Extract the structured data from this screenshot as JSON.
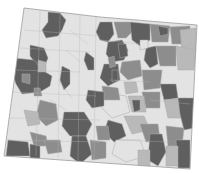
{
  "map": {
    "title": "",
    "subject": "Colorado choropleth (census-tract style)",
    "outline": [
      [
        24,
        8
      ],
      [
        100,
        17
      ],
      [
        197,
        25
      ],
      [
        190,
        169
      ],
      [
        4,
        156
      ]
    ],
    "palette": {
      "class1": "#e3e3e3",
      "class2": "#b9b9b9",
      "class3": "#8d8d8d",
      "class4": "#5f5f5f",
      "boundary": "#a8a8a8",
      "background": "#ffffff"
    },
    "regions": [
      {
        "cls": "class4",
        "points": "48,12 60,13 66,20 62,30 58,36 46,38 42,30 48,22"
      },
      {
        "cls": "class4",
        "points": "30,45 44,48 48,58 44,68 36,64 30,56"
      },
      {
        "cls": "class4",
        "points": "14,58 34,60 42,70 52,76 50,86 40,92 22,94 16,84 12,72"
      },
      {
        "cls": "class2",
        "points": "38,60 46,62 46,72 38,72"
      },
      {
        "cls": "class3",
        "points": "22,74 30,74 30,84 22,82"
      },
      {
        "cls": "class3",
        "points": "34,88 40,88 42,96 34,96"
      },
      {
        "cls": "class4",
        "points": "62,66 70,70 70,84 64,90 60,80"
      },
      {
        "cls": "class4",
        "points": "86,52 94,58 94,70 88,70 84,60"
      },
      {
        "cls": "class4",
        "points": "100,22 112,22 114,34 108,42 100,40 96,32"
      },
      {
        "cls": "class4",
        "points": "108,42 122,40 128,50 124,60 112,62 106,54"
      },
      {
        "cls": "class3",
        "points": "114,22 130,22 134,30 126,38 118,38"
      },
      {
        "cls": "class4",
        "points": "130,22 150,24 150,40 140,46 132,40"
      },
      {
        "cls": "class3",
        "points": "150,24 170,26 168,42 152,42"
      },
      {
        "cls": "class4",
        "points": "158,26 168,28 168,34 160,36"
      },
      {
        "cls": "class3",
        "points": "170,27 190,26 190,44 172,44"
      },
      {
        "cls": "class2",
        "points": "180,30 196,28 196,50 182,52"
      },
      {
        "cls": "class4",
        "points": "146,48 156,46 158,64 150,68 144,60"
      },
      {
        "cls": "class3",
        "points": "156,46 176,46 176,66 160,66"
      },
      {
        "cls": "class2",
        "points": "176,46 196,50 194,70 178,70"
      },
      {
        "cls": "class3",
        "points": "122,62 140,60 142,76 128,80 120,72"
      },
      {
        "cls": "class4",
        "points": "104,64 118,64 120,80 108,86 100,78"
      },
      {
        "cls": "class3",
        "points": "142,70 162,70 160,88 144,90"
      },
      {
        "cls": "class4",
        "points": "160,84 176,84 178,98 164,100"
      },
      {
        "cls": "class2",
        "points": "164,100 186,98 186,118 168,118"
      },
      {
        "cls": "class4",
        "points": "178,98 194,98 194,128 184,130 180,114"
      },
      {
        "cls": "class3",
        "points": "142,92 160,92 160,108 146,108"
      },
      {
        "cls": "class2",
        "points": "128,96 144,96 146,112 132,112"
      },
      {
        "cls": "class1",
        "points": "100,92 126,96 130,112 112,118 100,106"
      },
      {
        "cls": "class3",
        "points": "102,86 118,88 120,100 104,100"
      },
      {
        "cls": "class4",
        "points": "88,90 104,92 104,106 92,108 86,100"
      },
      {
        "cls": "class4",
        "points": "64,112 84,112 92,124 86,136 70,136 62,126"
      },
      {
        "cls": "class4",
        "points": "72,136 86,136 92,154 80,164 70,156"
      },
      {
        "cls": "class3",
        "points": "40,100 56,104 58,120 46,126 36,116"
      },
      {
        "cls": "class2",
        "points": "24,110 38,112 40,124 28,126"
      },
      {
        "cls": "class3",
        "points": "30,132 46,136 48,146 34,146"
      },
      {
        "cls": "class4",
        "points": "8,140 28,142 30,156 6,156"
      },
      {
        "cls": "class4",
        "points": "30,144 40,146 40,158 30,158"
      },
      {
        "cls": "class3",
        "points": "44,140 60,140 62,152 48,154"
      },
      {
        "cls": "class4",
        "points": "108,120 122,124 126,136 114,142 104,132"
      },
      {
        "cls": "class3",
        "points": "96,126 108,126 110,140 98,140"
      },
      {
        "cls": "class2",
        "points": "124,116 144,116 150,130 132,134"
      },
      {
        "cls": "class1",
        "points": "116,140 140,140 146,156 126,162 112,154"
      },
      {
        "cls": "class3",
        "points": "140,124 158,124 160,140 146,142"
      },
      {
        "cls": "class4",
        "points": "150,134 162,134 166,152 158,166 148,160"
      },
      {
        "cls": "class3",
        "points": "166,126 184,128 182,146 168,146"
      },
      {
        "cls": "class4",
        "points": "176,140 190,140 190,168 178,168"
      },
      {
        "cls": "class2",
        "points": "166,146 178,146 178,166 166,166"
      },
      {
        "cls": "class3",
        "points": "90,140 106,142 106,158 92,160"
      },
      {
        "cls": "class2",
        "points": "138,150 150,150 150,166 138,166"
      },
      {
        "cls": "class4",
        "points": "132,100 140,100 140,110 134,112"
      },
      {
        "cls": "class4",
        "points": "118,44 126,44 128,56 120,58"
      },
      {
        "cls": "class3",
        "points": "108,58 114,56 116,66 110,68"
      },
      {
        "cls": "class4",
        "points": "112,70 118,70 118,80 112,82"
      },
      {
        "cls": "class2",
        "points": "124,82 136,82 138,92 126,94"
      },
      {
        "cls": "class1",
        "points": "140,40 148,40 148,48 140,50"
      }
    ],
    "tract_lines": [
      "24,30 100,36",
      "20,48 90,52",
      "16,70 80,72",
      "12,92 96,96",
      "8,118 100,120",
      "6,140 100,142",
      "40,10 36,156",
      "60,12 58,158",
      "80,14 78,160",
      "96,16 94,160",
      "70,30 88,44",
      "66,50 80,62",
      "50,100 66,110",
      "58,80 72,98",
      "100,40 140,44",
      "110,80 150,82",
      "120,140 170,142",
      "150,100 190,104"
    ]
  }
}
